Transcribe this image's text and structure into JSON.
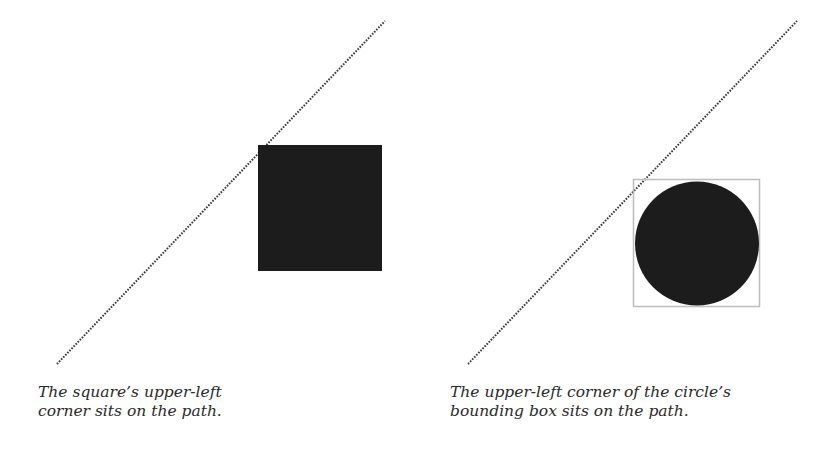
{
  "colors": {
    "background": "#ffffff",
    "path_line": "#3a3a3a",
    "shape_fill": "#1c1c1c",
    "bounding_box": "#bdbdbd",
    "caption_text": "#2a2a2a"
  },
  "panels": [
    {
      "name": "square-panel",
      "shape": "square",
      "path": {
        "x1": 57,
        "y1": 364,
        "x2": 385,
        "y2": 21,
        "style": "dotted"
      },
      "shape_box": {
        "x": 258,
        "y": 145,
        "width": 124,
        "height": 126
      },
      "caption_lines": [
        "The square’s upper-left",
        "corner sits on the path."
      ]
    },
    {
      "name": "circle-panel",
      "shape": "circle",
      "path": {
        "x1": 468,
        "y1": 364,
        "x2": 797,
        "y2": 21,
        "style": "dotted"
      },
      "bounding_box": {
        "x": 633,
        "y": 179,
        "width": 127,
        "height": 128
      },
      "circle": {
        "cx": 697,
        "cy": 243.5,
        "r": 62
      },
      "caption_lines": [
        "The upper-left corner of the circle’s",
        "bounding box sits on the path."
      ]
    }
  ]
}
